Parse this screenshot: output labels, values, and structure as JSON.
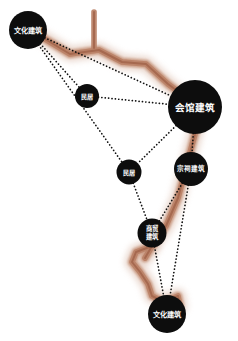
{
  "diagram": {
    "background_color": "#ffffff",
    "node_color": "#0d0d0d",
    "node_text_color": "#ffffff",
    "edge_color": "#111111",
    "road_color_outer": "#c99a82",
    "road_color_mid": "#bb8368",
    "road_color_core": "#a3664d",
    "road_shadow_color": "#d8b6a4"
  },
  "nodes": [
    {
      "id": "n1",
      "label": "文化建筑",
      "lines": [
        "文化建筑"
      ],
      "x": 28,
      "y": 30,
      "r": 19,
      "font_size": 7.2,
      "line_gap": 0
    },
    {
      "id": "n2",
      "label": "民居",
      "lines": [
        "民居"
      ],
      "x": 87,
      "y": 96,
      "r": 12,
      "font_size": 6.2,
      "line_gap": 0
    },
    {
      "id": "n3",
      "label": "会馆建筑",
      "lines": [
        "会馆建筑"
      ],
      "x": 195,
      "y": 107,
      "r": 27,
      "font_size": 9.6,
      "line_gap": 0
    },
    {
      "id": "n4",
      "label": "民居",
      "lines": [
        "民居"
      ],
      "x": 129,
      "y": 172,
      "r": 12.5,
      "font_size": 6.2,
      "line_gap": 0
    },
    {
      "id": "n5",
      "label": "宗祠建筑",
      "lines": [
        "宗祠建筑"
      ],
      "x": 191,
      "y": 169,
      "r": 17,
      "font_size": 6.6,
      "line_gap": 0
    },
    {
      "id": "n6",
      "label": "商贸建筑",
      "lines": [
        "商贸",
        "建筑"
      ],
      "x": 152,
      "y": 233,
      "r": 14.5,
      "font_size": 6.4,
      "line_gap": 7.4
    },
    {
      "id": "n7",
      "label": "文化建筑",
      "lines": [
        "文化建筑"
      ],
      "x": 167,
      "y": 314,
      "r": 19,
      "font_size": 7.2,
      "line_gap": 0
    }
  ],
  "edges": [
    {
      "from": "n1",
      "to": "n3",
      "name": "edge-culture-top-to-guildhall"
    },
    {
      "from": "n1",
      "to": "n2",
      "name": "edge-culture-top-to-folk-upper"
    },
    {
      "from": "n1",
      "to": "n4",
      "name": "edge-culture-top-to-folk-mid"
    },
    {
      "from": "n2",
      "to": "n3",
      "name": "edge-folk-upper-to-guildhall"
    },
    {
      "from": "n3",
      "to": "n4",
      "name": "edge-guildhall-to-folk-mid"
    },
    {
      "from": "n3",
      "to": "n5",
      "name": "edge-guildhall-to-ancestral"
    },
    {
      "from": "n4",
      "to": "n6",
      "name": "edge-folk-mid-to-commerce"
    },
    {
      "from": "n5",
      "to": "n6",
      "name": "edge-ancestral-to-commerce"
    },
    {
      "from": "n5",
      "to": "n7",
      "name": "edge-ancestral-to-culture-bottom"
    },
    {
      "from": "n6",
      "to": "n7",
      "name": "edge-commerce-to-culture-bottom"
    }
  ],
  "roads": [
    {
      "name": "road-north-stub",
      "points": "94,12 94,48"
    },
    {
      "name": "road-main-spine",
      "points": "40,36 70,54 99,50 122,62 146,64 168,84 188,99"
    },
    {
      "name": "road-guildhall-south",
      "points": "196,130 186,168 178,198 166,226 152,246 145,258"
    },
    {
      "name": "road-lower-zigzag",
      "points": "152,246 136,252 132,262 140,272 148,284 152,296 164,302 178,296 180,306 172,312"
    }
  ]
}
